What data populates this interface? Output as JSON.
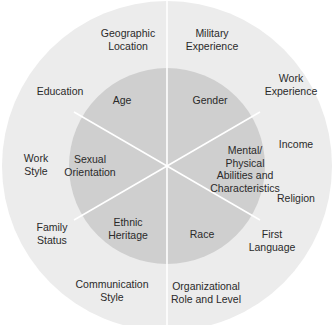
{
  "colors": {
    "outer_ring": "#ececec",
    "inner_circle": "#cfcfcf",
    "divider": "#ffffff",
    "text": "#2a2a2a"
  },
  "inner_dimensions": [
    {
      "label": "Age",
      "x": 122,
      "y": 100
    },
    {
      "label": "Gender",
      "x": 210,
      "y": 100
    },
    {
      "label": "Mental/\nPhysical\nAbilities and\nCharacteristics",
      "x": 245,
      "y": 169
    },
    {
      "label": "Race",
      "x": 202,
      "y": 234
    },
    {
      "label": "Ethnic\nHeritage",
      "x": 128,
      "y": 228
    },
    {
      "label": "Sexual\nOrientation",
      "x": 90,
      "y": 165
    }
  ],
  "outer_dimensions": [
    {
      "label": "Geographic\nLocation",
      "x": 128,
      "y": 39
    },
    {
      "label": "Military\nExperience",
      "x": 212,
      "y": 39
    },
    {
      "label": "Work\nExperience",
      "x": 291,
      "y": 84
    },
    {
      "label": "Income",
      "x": 296,
      "y": 144
    },
    {
      "label": "Religion",
      "x": 296,
      "y": 198
    },
    {
      "label": "First\nLanguage",
      "x": 272,
      "y": 240
    },
    {
      "label": "Organizational\nRole and Level",
      "x": 206,
      "y": 292
    },
    {
      "label": "Communication\nStyle",
      "x": 112,
      "y": 290
    },
    {
      "label": "Family\nStatus",
      "x": 52,
      "y": 233
    },
    {
      "label": "Work\nStyle",
      "x": 36,
      "y": 164
    },
    {
      "label": "Education",
      "x": 60,
      "y": 91
    }
  ]
}
